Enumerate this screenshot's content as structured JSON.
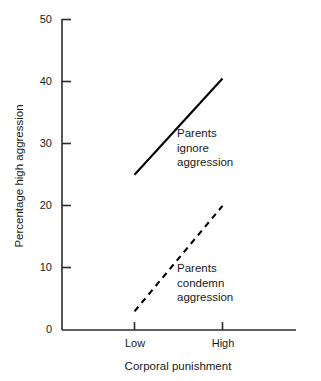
{
  "chart_data": {
    "type": "line",
    "title": "",
    "xlabel": "Corporal punishment",
    "ylabel": "Percentage high aggression",
    "categories": [
      "Low",
      "High"
    ],
    "x_tick_labels": [
      "Low",
      "High"
    ],
    "y_tick_labels": [
      "0",
      "10",
      "20",
      "30",
      "40",
      "50"
    ],
    "y_ticks": [
      0,
      10,
      20,
      30,
      40,
      50
    ],
    "ylim": [
      0,
      50
    ],
    "grid": false,
    "legend_position": "inline-annotation",
    "series": [
      {
        "name": "Parents ignore aggression",
        "style": "solid",
        "color": "#000000",
        "values": [
          25,
          40.5
        ],
        "annotation_lines": [
          "Parents",
          "ignore",
          "aggression"
        ]
      },
      {
        "name": "Parents condemn aggression",
        "style": "dashed",
        "color": "#000000",
        "values": [
          3,
          20
        ],
        "annotation_lines": [
          "Parents",
          "condemn",
          "aggression"
        ]
      }
    ]
  },
  "axes": {
    "y_title": "Percentage high aggression",
    "x_title": "Corporal punishment",
    "y_labels": {
      "t0": "0",
      "t10": "10",
      "t20": "20",
      "t30": "30",
      "t40": "40",
      "t50": "50"
    },
    "x_labels": {
      "low": "Low",
      "high": "High"
    }
  },
  "annotations": {
    "ignore": {
      "line1": "Parents",
      "line2": "ignore",
      "line3": "aggression"
    },
    "condemn": {
      "line1": "Parents",
      "line2": "condemn",
      "line3": "aggression"
    }
  },
  "colors": {
    "ink": "#000000",
    "axis": "#2b2b2b",
    "background": "#ffffff"
  }
}
